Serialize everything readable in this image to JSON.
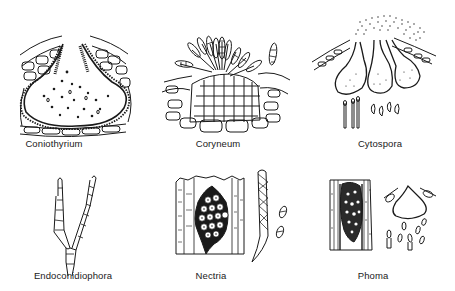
{
  "plate": {
    "background": "#ffffff",
    "ink_color": "#1a1a1a",
    "panels": [
      {
        "id": "coniothyrium",
        "label": "Coniothyrium",
        "label_x": 54,
        "label_y": 140
      },
      {
        "id": "coryneum",
        "label": "Coryneum",
        "label_x": 218,
        "label_y": 140
      },
      {
        "id": "cytospora",
        "label": "Cytospora",
        "label_x": 380,
        "label_y": 140
      },
      {
        "id": "endoconidiophora",
        "label": "Endoconidiophora",
        "label_x": 73,
        "label_y": 272
      },
      {
        "id": "nectria",
        "label": "Nectria",
        "label_x": 211,
        "label_y": 272
      },
      {
        "id": "phoma",
        "label": "Phoma",
        "label_x": 373,
        "label_y": 272
      }
    ]
  }
}
